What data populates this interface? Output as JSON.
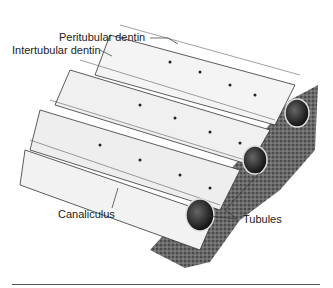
{
  "figure": {
    "labels": {
      "peritubular": "Peritubular dentin",
      "intertubular": "Intertubular dentin",
      "canaliculus": "Canaliculus",
      "tubules": "Tubules"
    }
  }
}
